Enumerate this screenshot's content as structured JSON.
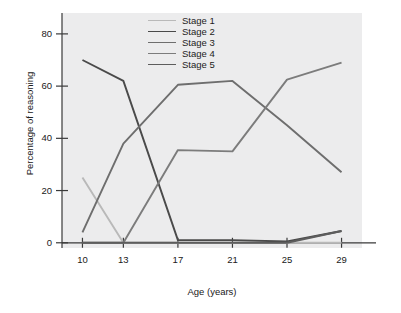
{
  "chart_data": {
    "type": "line",
    "title": "",
    "xlabel": "Age (years)",
    "ylabel": "Percentage of reasoning",
    "x": [
      10,
      13,
      17,
      21,
      25,
      29
    ],
    "xtick_labels": [
      "10",
      "13",
      "17",
      "21",
      "25",
      "29"
    ],
    "ytick_labels": [
      "0",
      "20",
      "40",
      "60",
      "80"
    ],
    "yticks": [
      0,
      20,
      40,
      60,
      80
    ],
    "xlim": [
      8.5,
      30.5
    ],
    "ylim": [
      -2,
      88
    ],
    "grid": false,
    "legend_position": "top-center",
    "background": "#ececed",
    "series": [
      {
        "name": "Stage 1",
        "color": "#b9b9b9",
        "values": [
          25,
          0,
          0,
          0,
          0,
          0
        ]
      },
      {
        "name": "Stage 2",
        "color": "#4a4a4a",
        "values": [
          70,
          62,
          1,
          1,
          0.5,
          4.5
        ]
      },
      {
        "name": "Stage 3",
        "color": "#6e6e6e",
        "values": [
          4,
          38,
          60.5,
          62,
          45,
          27
        ]
      },
      {
        "name": "Stage 4",
        "color": "#7c7c7c",
        "values": [
          0,
          0,
          35.5,
          35,
          62.5,
          69
        ]
      },
      {
        "name": "Stage 5",
        "color": "#5d5d5d",
        "values": [
          0,
          0,
          0,
          0,
          0,
          4.5
        ]
      }
    ]
  },
  "axes": {
    "axis_color": "#3a3a3a",
    "tick_color": "#3a3a3a"
  }
}
